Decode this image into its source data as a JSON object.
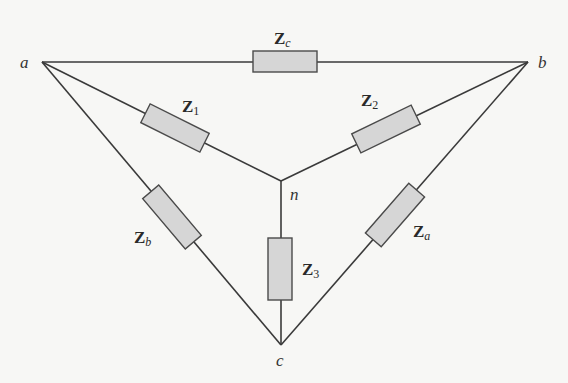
{
  "diagram": {
    "type": "delta-wye impedance network",
    "nodes": {
      "a": {
        "label": "a",
        "x": 42,
        "y": 62
      },
      "b": {
        "label": "b",
        "x": 528,
        "y": 62
      },
      "n": {
        "label": "n",
        "x": 281,
        "y": 181
      },
      "c": {
        "label": "c",
        "x": 281,
        "y": 345
      }
    },
    "impedances": {
      "Zc": {
        "main": "Z",
        "sub": "c",
        "between": "a-b"
      },
      "Z1": {
        "main": "Z",
        "sub": "1",
        "between": "a-n"
      },
      "Z2": {
        "main": "Z",
        "sub": "2",
        "between": "b-n"
      },
      "Zb": {
        "main": "Z",
        "sub": "b",
        "between": "a-c"
      },
      "Za": {
        "main": "Z",
        "sub": "a",
        "between": "b-c"
      },
      "Z3": {
        "main": "Z",
        "sub": "3",
        "between": "n-c"
      }
    },
    "colors": {
      "wire": "#3a3a3a",
      "resistor_fill": "#d6d6d6",
      "resistor_stroke": "#4a4a4a",
      "background": "#f7f7f5"
    }
  }
}
